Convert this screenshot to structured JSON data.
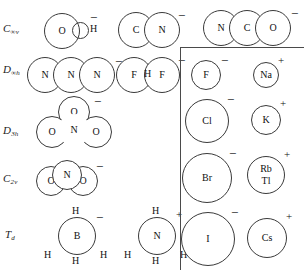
{
  "figure": {
    "background": "#ffffff",
    "stroke_color": "#3a3a3a",
    "text_color": "#111111"
  },
  "symmetry_labels": [
    {
      "id": "c-inf-v",
      "base": "C",
      "sub": "∞v",
      "text": "C∞v"
    },
    {
      "id": "d-inf-h",
      "base": "D",
      "sub": "∞h",
      "text": "D∞h"
    },
    {
      "id": "d-3h",
      "base": "D",
      "sub": "3h",
      "text": "D3h"
    },
    {
      "id": "c-2v",
      "base": "C",
      "sub": "2v",
      "text": "C2v"
    },
    {
      "id": "t-d",
      "base": "T",
      "sub": "d",
      "text": "Td"
    }
  ],
  "column1": {
    "hydroxide": {
      "name": "hydroxide",
      "atoms": [
        "O",
        "H"
      ],
      "charge": "−"
    },
    "azide": {
      "name": "azide",
      "atoms": [
        "N",
        "N",
        "N"
      ],
      "charge": "−"
    },
    "nitrate": {
      "name": "nitrate",
      "atoms": [
        "O",
        "O",
        "N",
        "O"
      ],
      "charge": "−"
    },
    "nitrite": {
      "name": "nitrite",
      "atoms": [
        "O",
        "N",
        "O"
      ],
      "charge": "−"
    },
    "borohydride": {
      "name": "borohydride",
      "atoms": [
        "H",
        "B",
        "H",
        "H",
        "H"
      ],
      "charge": "−"
    }
  },
  "column2": {
    "cyanide": {
      "name": "cyanide",
      "atoms": [
        "C",
        "N"
      ],
      "charge": "−"
    },
    "bifluoride": {
      "name": "bifluoride",
      "atoms": [
        "F",
        "H",
        "F"
      ],
      "charge": "−"
    },
    "ammonium": {
      "name": "ammonium",
      "atoms": [
        "H",
        "N",
        "H",
        "H",
        "H"
      ],
      "charge": "+"
    }
  },
  "column3": {
    "cyanate": {
      "name": "cyanate",
      "atoms": [
        "N",
        "C",
        "O"
      ],
      "charge": "−"
    }
  },
  "monatomic_panel": {
    "anions": [
      {
        "symbol": "F",
        "charge": "−"
      },
      {
        "symbol": "Cl",
        "charge": "−"
      },
      {
        "symbol": "Br",
        "charge": "−"
      },
      {
        "symbol": "I",
        "charge": "−"
      }
    ],
    "cations": [
      {
        "symbol": "Na",
        "charge": "+"
      },
      {
        "symbol": "K",
        "charge": "+"
      },
      {
        "symbol": "Rb",
        "symbol2": "Tl",
        "charge": "+"
      },
      {
        "symbol": "Cs",
        "charge": "+"
      }
    ]
  }
}
